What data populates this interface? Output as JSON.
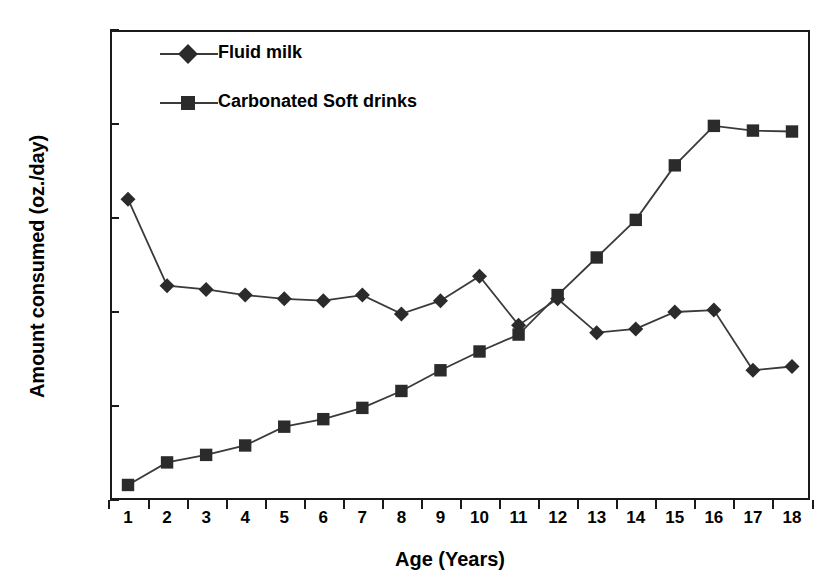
{
  "chart_data": {
    "type": "line",
    "title": "",
    "xlabel": "Age (Years)",
    "ylabel": "Amount consumed (oz./day)",
    "x": [
      1,
      2,
      3,
      4,
      5,
      6,
      7,
      8,
      9,
      10,
      11,
      12,
      13,
      14,
      15,
      16,
      17,
      18
    ],
    "xtick_labels": [
      "1",
      "2",
      "3",
      "4",
      "5",
      "6",
      "7",
      "8",
      "9",
      "10",
      "11",
      "12",
      "13",
      "14",
      "15",
      "16",
      "17",
      "18"
    ],
    "ytick_labels": [
      "0",
      "5",
      "10",
      "15",
      "20",
      "25"
    ],
    "yticks": [
      0,
      5,
      10,
      15,
      20,
      25
    ],
    "xlim": [
      0.5,
      18.5
    ],
    "ylim": [
      0,
      25
    ],
    "grid": false,
    "legend_position": "top-left-inside",
    "series": [
      {
        "name": "Fluid milk",
        "marker": "diamond",
        "color": "#2b2b2b",
        "values": [
          16.0,
          11.4,
          11.2,
          10.9,
          10.7,
          10.6,
          10.9,
          9.9,
          10.6,
          11.9,
          9.3,
          10.7,
          8.9,
          9.1,
          10.0,
          10.1,
          6.9,
          7.1
        ]
      },
      {
        "name": "Carbonated Soft drinks",
        "marker": "square",
        "color": "#2b2b2b",
        "values": [
          0.8,
          2.0,
          2.4,
          2.9,
          3.9,
          4.3,
          4.9,
          5.8,
          6.9,
          7.9,
          8.8,
          10.9,
          12.9,
          14.9,
          17.8,
          19.9,
          19.65,
          19.6
        ]
      }
    ]
  },
  "legend": {
    "entries": [
      {
        "label": "Fluid milk",
        "marker": "diamond"
      },
      {
        "label": "Carbonated Soft drinks",
        "marker": "square"
      }
    ]
  },
  "axes": {
    "x_title": "Age (Years)",
    "y_title": "Amount consumed (oz./day)"
  },
  "colors": {
    "line": "#3a3a3a",
    "marker": "#2b2b2b",
    "frame": "#1a1a1a",
    "background": "#ffffff"
  }
}
